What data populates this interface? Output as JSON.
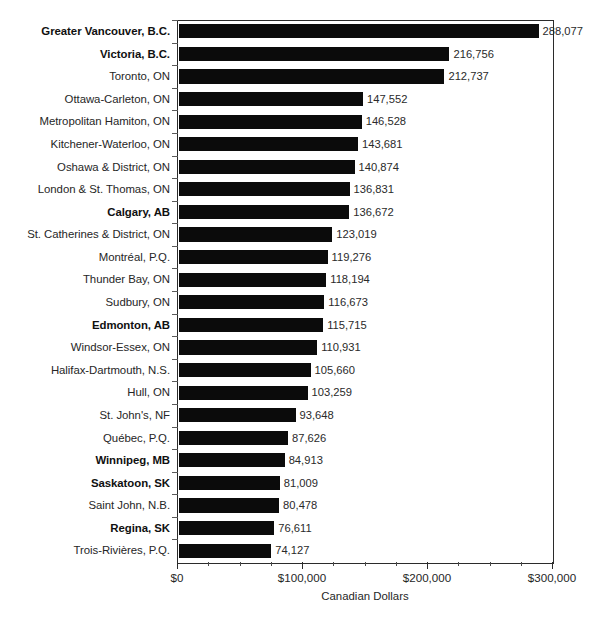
{
  "chart_data": {
    "type": "bar",
    "orientation": "horizontal",
    "title": "",
    "xlabel": "Canadian Dollars",
    "ylabel": "",
    "xlim": [
      0,
      300000
    ],
    "grid": false,
    "legend": null,
    "xticks": [
      "$0",
      "$100,000",
      "$200,000",
      "$300,000"
    ],
    "xtick_values": [
      0,
      100000,
      200000,
      300000
    ],
    "minor_tick_step": 25000,
    "categories": [
      "Greater Vancouver, B.C.",
      "Victoria, B.C.",
      "Toronto, ON",
      "Ottawa-Carleton, ON",
      "Metropolitan Hamiton, ON",
      "Kitchener-Waterloo, ON",
      "Oshawa & District, ON",
      "London & St. Thomas, ON",
      "Calgary, AB",
      "St. Catherines & District, ON",
      "Montréal, P.Q.",
      "Thunder Bay, ON",
      "Sudbury, ON",
      "Edmonton, AB",
      "Windsor-Essex, ON",
      "Halifax-Dartmouth, N.S.",
      "Hull, ON",
      "St. John's, NF",
      "Québec, P.Q.",
      "Winnipeg, MB",
      "Saskatoon, SK",
      "Saint John, N.B.",
      "Regina, SK",
      "Trois-Rivières, P.Q."
    ],
    "values": [
      288077,
      216756,
      212737,
      147552,
      146528,
      143681,
      140874,
      136831,
      136672,
      123019,
      119276,
      118194,
      116673,
      115715,
      110931,
      105660,
      103259,
      93648,
      87626,
      84913,
      81009,
      80478,
      76611,
      74127
    ],
    "value_labels": [
      "288,077",
      "216,756",
      "212,737",
      "147,552",
      "146,528",
      "143,681",
      "140,874",
      "136,831",
      "136,672",
      "123,019",
      "119,276",
      "118,194",
      "116,673",
      "115,715",
      "110,931",
      "105,660",
      "103,259",
      "93,648",
      "87,626",
      "84,913",
      "81,009",
      "80,478",
      "76,611",
      "74,127"
    ],
    "emphasized": [
      true,
      true,
      false,
      false,
      false,
      false,
      false,
      false,
      true,
      false,
      false,
      false,
      false,
      true,
      false,
      false,
      false,
      false,
      false,
      true,
      true,
      false,
      true,
      false
    ],
    "bar_color": "#0b0b0b",
    "text_color": "#262626",
    "axis_color": "#2b2b2b",
    "background_color": "#ffffff"
  }
}
